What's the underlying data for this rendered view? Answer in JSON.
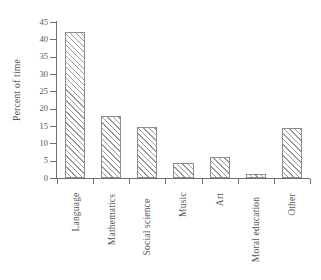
{
  "chart_data": {
    "type": "bar",
    "title": "",
    "subtitle": "",
    "xlabel": "",
    "ylabel": "Percent of time",
    "categories": [
      "Language",
      "Mathematics",
      "Social science",
      "Music",
      "Art",
      "Moral education",
      "Other"
    ],
    "values": [
      42,
      18,
      14.7,
      4.4,
      6.1,
      1.3,
      14.3
    ],
    "ylim": [
      0,
      45
    ],
    "y_ticks": [
      0,
      5,
      10,
      15,
      20,
      25,
      30,
      35,
      40,
      45
    ],
    "y_tick_labels": [
      "0",
      "5",
      "10",
      "15",
      "20",
      "25",
      "30",
      "35",
      "40",
      "45"
    ],
    "grid": false,
    "legend": null,
    "legend_position": "none",
    "bar_fill": "hatch-diagonal-45",
    "bar_edge_color": "#8d8d8d",
    "hatch_color": "#9a9a9a",
    "background_color": "#ffffff",
    "axis_color": "#6f6f6f",
    "text_color": "#555555"
  }
}
